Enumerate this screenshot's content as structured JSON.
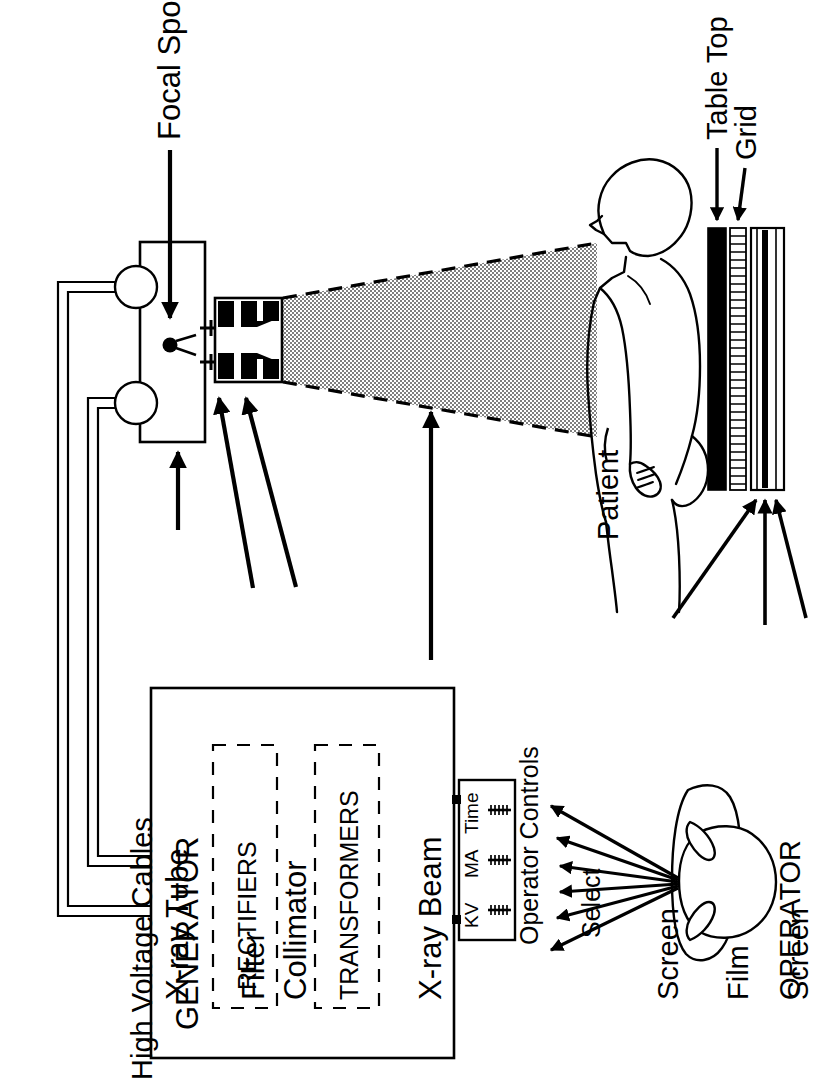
{
  "figure": {
    "orientation": "rotated-90-ccw",
    "background_color": "#ffffff",
    "line_color": "#000000",
    "beam_fill_color": "#9a9a9a",
    "table_top_color": "#000000",
    "grid_color": "#000000"
  },
  "labels": {
    "focal_spot": "Focal Spot",
    "high_voltage_cables": "High Voltage Cables",
    "xray_tube": "X-ray Tube",
    "filter": "Filter",
    "collimator": "Collimator",
    "xray_beam": "X-ray Beam",
    "patient": "Patient",
    "table_top": "Table Top",
    "grid": "Grid",
    "screen_top": "Screen",
    "film": "Film",
    "screen_bottom": "Screen",
    "generator": "GENERATOR",
    "rectifiers": "RECTIFIERS",
    "transformers": "TRANSFORMERS",
    "operator_controls": "Operator Controls",
    "select": "Select",
    "operator": "OPERATOR"
  },
  "operator_controls_panel": {
    "dials": [
      {
        "name": "KV",
        "label": "KV"
      },
      {
        "name": "MA",
        "label": "MA"
      },
      {
        "name": "Time",
        "label": "Time"
      }
    ],
    "arrow_count": 6
  },
  "image_receptor_stack": {
    "layers": [
      {
        "name": "table-top",
        "label": "Table Top",
        "style": "solid-black"
      },
      {
        "name": "grid",
        "label": "Grid",
        "style": "hatched"
      },
      {
        "name": "cassette",
        "label": "Screen / Film / Screen",
        "style": "three-thin-layers"
      }
    ]
  },
  "generator_modules": [
    {
      "name": "rectifiers",
      "label": "RECTIFIERS"
    },
    {
      "name": "transformers",
      "label": "TRANSFORMERS"
    }
  ]
}
